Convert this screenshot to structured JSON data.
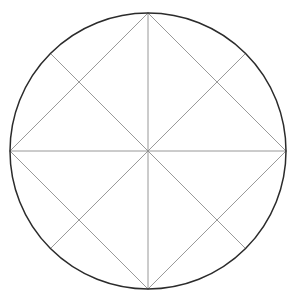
{
  "figure": {
    "title": "Circle with inscribed square and radial diagonals",
    "background_color": "#ffffff",
    "canvas": {
      "width": 299,
      "height": 304
    }
  },
  "chart_data": {
    "type": "diagram",
    "title": "Circle with inscribed square and radial diagonals",
    "subtitle": "",
    "xlabel": "",
    "ylabel": "",
    "grid": false,
    "legend": "none",
    "axis_ranges": {
      "x": [
        0,
        299
      ],
      "y": [
        0,
        304
      ]
    },
    "geometry": {
      "center": {
        "x": 148,
        "y": 151
      },
      "radius": 138,
      "circle_stroke_color": "#2b2b2b",
      "circle_stroke_width": 1.5,
      "line_stroke_color": "#8d8d8d",
      "line_stroke_width": 0.9,
      "points": {
        "center": {
          "x": 148,
          "y": 151,
          "angle_deg": null,
          "label": "center"
        },
        "top": {
          "x": 148,
          "y": 13,
          "angle_deg": 90,
          "label": "top-vertex"
        },
        "right": {
          "x": 286,
          "y": 151,
          "angle_deg": 0,
          "label": "right-vertex"
        },
        "bottom": {
          "x": 148,
          "y": 289,
          "angle_deg": 270,
          "label": "bottom-vertex"
        },
        "left": {
          "x": 10,
          "y": 151,
          "angle_deg": 180,
          "label": "left-vertex"
        },
        "top_right_45": {
          "x": 245.6,
          "y": 53.4,
          "angle_deg": 45,
          "label": "diagonal-endpoint-ne"
        },
        "top_left_135": {
          "x": 50.4,
          "y": 53.4,
          "angle_deg": 135,
          "label": "diagonal-endpoint-nw"
        },
        "bot_left_225": {
          "x": 50.4,
          "y": 248.6,
          "angle_deg": 225,
          "label": "diagonal-endpoint-sw"
        },
        "bot_right_315": {
          "x": 245.6,
          "y": 248.6,
          "angle_deg": 315,
          "label": "diagonal-endpoint-se"
        }
      },
      "segments": [
        {
          "name": "horizontal-diameter",
          "from": "left",
          "to": "right"
        },
        {
          "name": "vertical-diameter",
          "from": "top",
          "to": "bottom"
        },
        {
          "name": "square-edge-top-left",
          "from": "top",
          "to": "left"
        },
        {
          "name": "square-edge-top-right",
          "from": "top",
          "to": "right"
        },
        {
          "name": "square-edge-bottom-right",
          "from": "right",
          "to": "bottom"
        },
        {
          "name": "square-edge-bottom-left",
          "from": "bottom",
          "to": "left"
        },
        {
          "name": "radius-diagonal-ne",
          "from": "center",
          "to": "top_right_45"
        },
        {
          "name": "radius-diagonal-nw",
          "from": "center",
          "to": "top_left_135"
        },
        {
          "name": "radius-diagonal-sw",
          "from": "center",
          "to": "bot_left_225"
        },
        {
          "name": "radius-diagonal-se",
          "from": "center",
          "to": "bot_right_315"
        }
      ],
      "counts": {
        "circles": 1,
        "inscribed_square_edges": 4,
        "diameters": 2,
        "radial_diagonals": 4,
        "total_straight_lines": 10
      }
    },
    "annotations": [],
    "tick_labels": {
      "x": [],
      "y": []
    },
    "legend_entries": []
  }
}
